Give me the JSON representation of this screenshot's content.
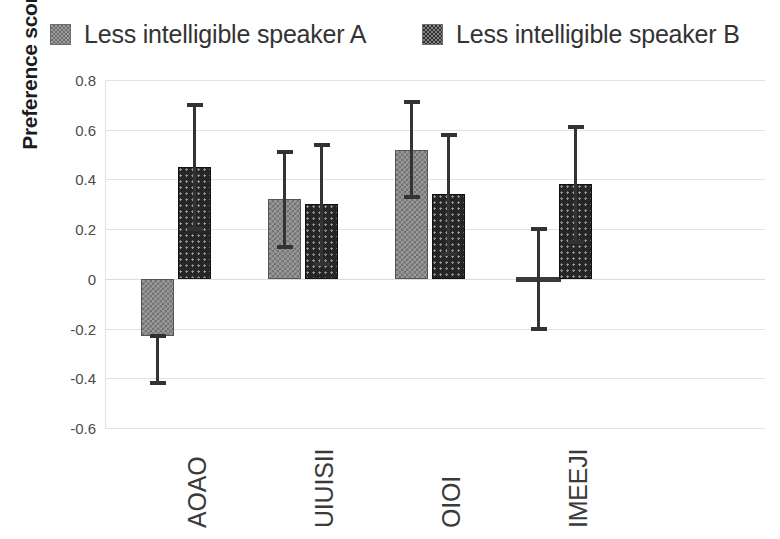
{
  "legend": {
    "position": "top",
    "items": [
      {
        "label": "Less intelligible speaker A",
        "swatch": "light-gray-checker-swatch"
      },
      {
        "label": "Less intelligible speaker B",
        "swatch": "dark-checker-swatch"
      }
    ]
  },
  "axes": {
    "ylabel": "Preference score",
    "yticks": [
      "0.8",
      "0.6",
      "0.4",
      "0.2",
      "0",
      "-0.2",
      "-0.4",
      "-0.6"
    ],
    "xlabel": ""
  },
  "chart_data": {
    "type": "bar",
    "title": "",
    "xlabel": "",
    "ylabel": "Preference score",
    "ylim": [
      -0.6,
      0.8
    ],
    "ytick_values": [
      0.8,
      0.6,
      0.4,
      0.2,
      0,
      -0.2,
      -0.4,
      -0.6
    ],
    "grid": true,
    "legend_position": "top",
    "error_bars": "symmetric-caps",
    "categories": [
      "AOAO",
      "UIUISII",
      "OIOI",
      "IMEEJI"
    ],
    "series": [
      {
        "name": "Less intelligible speaker A",
        "values": [
          -0.23,
          0.32,
          0.52,
          0.0
        ],
        "error_upper": [
          0.0,
          0.19,
          0.19,
          0.2
        ],
        "error_lower": [
          0.19,
          0.19,
          0.19,
          0.2
        ],
        "error_top": [
          -0.23,
          0.51,
          0.71,
          0.2
        ],
        "error_bottom": [
          -0.42,
          0.13,
          0.33,
          -0.2
        ]
      },
      {
        "name": "Less intelligible speaker B",
        "values": [
          0.45,
          0.3,
          0.34,
          0.38
        ],
        "error_upper": [
          0.25,
          0.24,
          0.24,
          0.23
        ],
        "error_lower": [
          0.25,
          0.24,
          0.24,
          0.23
        ],
        "error_top": [
          0.7,
          0.54,
          0.58,
          0.61
        ],
        "error_bottom": [
          0.2,
          0.06,
          0.1,
          0.15
        ]
      }
    ]
  },
  "colors": {
    "series_a": "#9a9a9a",
    "series_b": "#262626",
    "gridline": "#e2e2e2",
    "text": "#333333"
  }
}
